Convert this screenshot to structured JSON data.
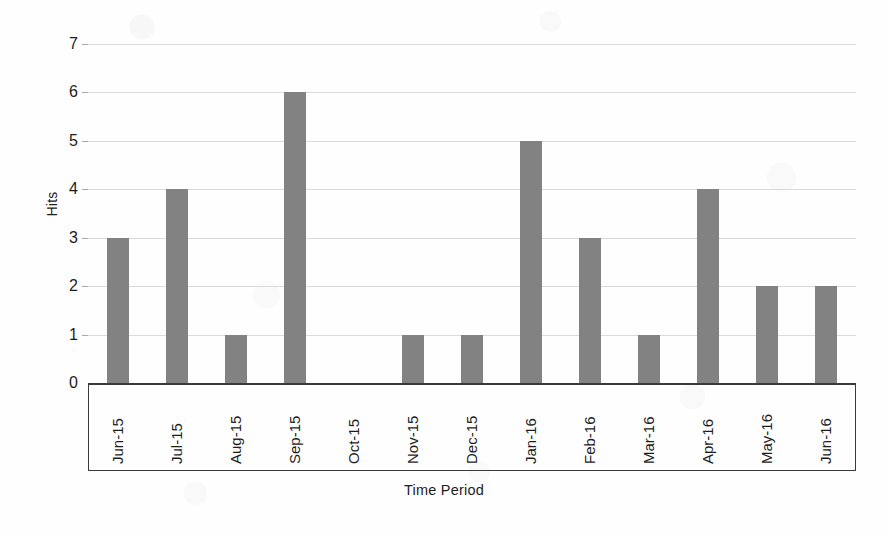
{
  "chart_data": {
    "type": "bar",
    "title": "",
    "xlabel": "Time Period",
    "ylabel": "Hits",
    "categories": [
      "Jun-15",
      "Jul-15",
      "Aug-15",
      "Sep-15",
      "Oct-15",
      "Nov-15",
      "Dec-15",
      "Jan-16",
      "Feb-16",
      "Mar-16",
      "Apr-16",
      "May-16",
      "Jun-16"
    ],
    "values": [
      3,
      4,
      1,
      6,
      0,
      1,
      1,
      5,
      3,
      1,
      4,
      2,
      2
    ],
    "ylim": [
      0,
      7
    ],
    "ytick_labels": [
      "0",
      "1",
      "2",
      "3",
      "4",
      "5",
      "6",
      "7"
    ],
    "ytick_values": [
      0,
      1,
      2,
      3,
      4,
      5,
      6,
      7
    ],
    "grid": true,
    "legend": null,
    "bar_color": "#828282",
    "gridline_color": "#dadada",
    "axis_color": "#3a3a3a",
    "background_color": "#fefefe"
  }
}
